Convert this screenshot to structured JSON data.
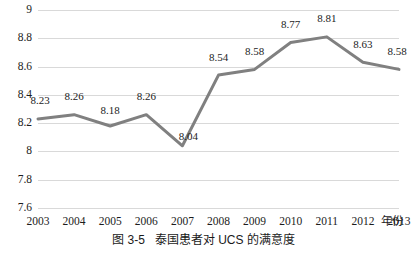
{
  "chart_data": {
    "type": "line",
    "title": "",
    "xlabel": "年份",
    "ylabel": "",
    "categories": [
      "2003",
      "2004",
      "2005",
      "2006",
      "2007",
      "2008",
      "2009",
      "2010",
      "2011",
      "2012",
      "2013"
    ],
    "values": [
      8.23,
      8.26,
      8.18,
      8.26,
      8.04,
      8.54,
      8.58,
      8.77,
      8.81,
      8.63,
      8.58
    ],
    "point_labels": [
      "8.23",
      "8.26",
      "8.18",
      "8.26",
      "8.04",
      "8.54",
      "8.58",
      "8.77",
      "8.81",
      "8.63",
      "8.58"
    ],
    "ylim": [
      7.6,
      9.0
    ],
    "ytick_step": 0.2,
    "yticks": [
      9,
      8.8,
      8.6,
      8.4,
      8.2,
      8,
      7.8,
      7.6
    ],
    "ytick_labels": [
      "9",
      "8.8",
      "8.6",
      "8.4",
      "8.2",
      "8",
      "7.8",
      "7.6"
    ],
    "grid": "horizontal",
    "legend": "none",
    "series_color": "#808080",
    "gridline_color": "#d9d9d9",
    "line_width": 3,
    "markers": "none"
  },
  "caption": {
    "number": "图 3-5",
    "text": "泰国患者对 UCS 的满意度"
  }
}
